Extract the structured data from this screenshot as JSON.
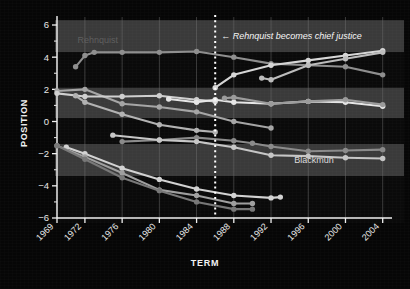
{
  "chart_data": {
    "type": "line",
    "title": "",
    "xlabel": "TERM",
    "ylabel": "POSITION",
    "xlim": [
      1969,
      2005
    ],
    "ylim": [
      -6,
      6
    ],
    "yticks": [
      -6,
      -4,
      -2,
      0,
      2,
      4,
      6
    ],
    "ytick_labels": [
      "−6",
      "−4",
      "−2",
      "0",
      "2",
      "4",
      "6"
    ],
    "xticks": [
      1969,
      1972,
      1976,
      1980,
      1984,
      1988,
      1992,
      1996,
      2000,
      2004
    ],
    "xtick_labels": [
      "1969",
      "1972",
      "1976",
      "1980",
      "1984",
      "1988",
      "1992",
      "1996",
      "2000",
      "2004"
    ],
    "grid": "vertical gridlines at xticks; alternating horizontal gray bands",
    "legend": "none (inline series labels)",
    "annotations": [
      {
        "name": "rehnquist-chief-justice",
        "text": "← Rehnquist becomes chief justice",
        "x": 1986,
        "y": 5.1,
        "marker": "dotted vertical line at 1986"
      },
      {
        "name": "rehnquist-series-label",
        "text": "Rehnquist",
        "x": 1971.2,
        "y": 4.85
      },
      {
        "name": "blackmun-series-label",
        "text": "Blackmun",
        "x": 1994.5,
        "y": -2.55
      }
    ],
    "vline": {
      "x": 1986,
      "style": "dotted",
      "color": "#ffffff"
    },
    "bands": [
      {
        "from": 6.3,
        "to": 4.3,
        "shade": "light"
      },
      {
        "from": 4.3,
        "to": 2.1,
        "shade": "dark"
      },
      {
        "from": 2.1,
        "to": 0.2,
        "shade": "light"
      },
      {
        "from": 0.2,
        "to": -1.4,
        "shade": "dark"
      },
      {
        "from": -1.4,
        "to": -3.4,
        "shade": "light"
      },
      {
        "from": -3.4,
        "to": -6.3,
        "shade": "dark"
      }
    ],
    "series": [
      {
        "name": "Rehnquist",
        "color": "#8e8e8e",
        "x": [
          1971,
          1972,
          1973,
          1976,
          1980,
          1984,
          1988,
          1992,
          1996,
          2000,
          2004
        ],
        "values": [
          3.4,
          4.1,
          4.3,
          4.3,
          4.3,
          4.35,
          4.0,
          3.6,
          3.5,
          3.4,
          2.9
        ]
      },
      {
        "name": "Scalia",
        "color": "#d6d6d6",
        "x": [
          1986,
          1988,
          1992,
          1996,
          2000,
          2004
        ],
        "values": [
          2.1,
          2.9,
          3.5,
          3.8,
          4.1,
          4.4
        ]
      },
      {
        "name": "Thomas",
        "color": "#bcbcbc",
        "x": [
          1991,
          1992,
          1996,
          2000,
          2004
        ],
        "values": [
          2.7,
          2.6,
          3.5,
          3.9,
          4.3
        ]
      },
      {
        "name": "White",
        "color": "#a5a5a5",
        "x": [
          1969,
          1972,
          1976,
          1980,
          1984,
          1988,
          1992
        ],
        "values": [
          1.9,
          2.0,
          1.1,
          0.9,
          0.6,
          0.0,
          -0.4
        ]
      },
      {
        "name": "Burger",
        "color": "#cfcfcf",
        "x": [
          1969,
          1972,
          1976,
          1980,
          1984,
          1986
        ],
        "values": [
          1.75,
          1.55,
          1.55,
          1.6,
          1.35,
          1.25
        ]
      },
      {
        "name": "OConnor",
        "color": "#e6e6e6",
        "x": [
          1981,
          1984,
          1986,
          1988,
          1992,
          1996,
          2000,
          2004
        ],
        "values": [
          1.4,
          1.2,
          1.35,
          1.2,
          1.1,
          1.25,
          1.2,
          0.95
        ]
      },
      {
        "name": "Kennedy",
        "color": "#9b9b9b",
        "x": [
          1987,
          1988,
          1992,
          1996,
          2000,
          2004
        ],
        "values": [
          1.45,
          1.5,
          1.1,
          1.25,
          1.35,
          1.05
        ]
      },
      {
        "name": "Powell",
        "color": "#b2b2b2",
        "x": [
          1971,
          1972,
          1976,
          1980,
          1984,
          1986
        ],
        "values": [
          1.6,
          1.2,
          0.45,
          -0.2,
          -0.55,
          -0.65
        ]
      },
      {
        "name": "Souter",
        "color": "#8a8a8a",
        "x": [
          1976,
          1980,
          1984,
          1988,
          1990,
          1992,
          1996,
          2000,
          2004
        ],
        "values": [
          -1.25,
          -1.15,
          -1.0,
          -1.2,
          -1.35,
          -1.55,
          -1.85,
          -1.8,
          -1.75
        ]
      },
      {
        "name": "Stevens",
        "color": "#c6c6c6",
        "x": [
          1975,
          1980,
          1984,
          1988,
          1992,
          1996,
          2000,
          2004
        ],
        "values": [
          -0.85,
          -1.15,
          -1.25,
          -1.6,
          -2.1,
          -2.15,
          -2.25,
          -2.3
        ]
      },
      {
        "name": "Blackmun",
        "color": "#d2d2d2",
        "x": [
          1970,
          1972,
          1976,
          1980,
          1984,
          1988,
          1992,
          1993
        ],
        "values": [
          -1.6,
          -2.0,
          -2.9,
          -3.6,
          -4.2,
          -4.6,
          -4.75,
          -4.7
        ]
      },
      {
        "name": "Marshall",
        "color": "#9f9f9f",
        "x": [
          1969,
          1972,
          1976,
          1980,
          1984,
          1988,
          1990
        ],
        "values": [
          -1.5,
          -2.2,
          -3.2,
          -4.25,
          -4.6,
          -5.1,
          -5.1
        ]
      },
      {
        "name": "Brennan",
        "color": "#777777",
        "x": [
          1969,
          1972,
          1976,
          1980,
          1984,
          1988,
          1990
        ],
        "values": [
          -1.5,
          -2.35,
          -3.5,
          -4.3,
          -5.0,
          -5.45,
          -5.45
        ]
      }
    ]
  }
}
